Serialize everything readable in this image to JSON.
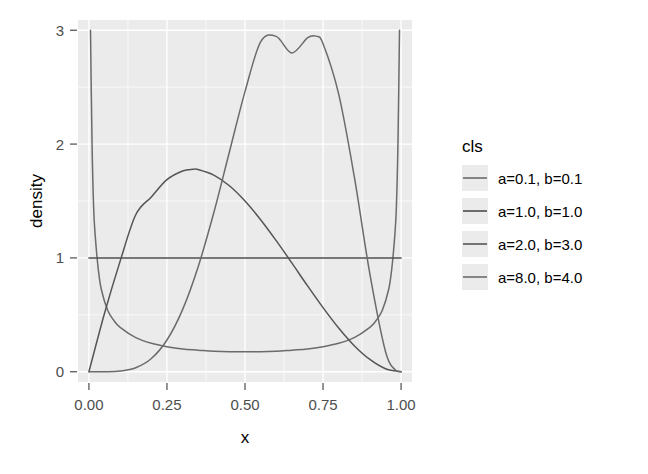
{
  "chart_data": {
    "type": "line",
    "title": "",
    "subtitle": "",
    "xlabel": "x",
    "ylabel": "density",
    "xlim": [
      -0.035,
      1.035
    ],
    "ylim": [
      -0.09,
      3.09
    ],
    "xticks": [
      "0.00",
      "0.25",
      "0.50",
      "0.75",
      "1.00"
    ],
    "xtick_values": [
      0.0,
      0.25,
      0.5,
      0.75,
      1.0
    ],
    "yticks": [
      "0",
      "1",
      "2",
      "3"
    ],
    "ytick_values": [
      0,
      1,
      2,
      3
    ],
    "grid": "major and minor white gridlines on grey panel",
    "legend_position": "right",
    "legend_title": "cls",
    "panel_background": "#ebebeb",
    "gridline_color": "#ffffff",
    "series": [
      {
        "name": "a=0.1, b=0.1",
        "color": "#6b6b6b",
        "distribution": "Beta(0.1, 0.1)",
        "x": [
          0.005,
          0.01,
          0.015,
          0.02,
          0.03,
          0.04,
          0.06,
          0.08,
          0.1,
          0.15,
          0.2,
          0.25,
          0.3,
          0.35,
          0.4,
          0.45,
          0.5,
          0.55,
          0.6,
          0.65,
          0.7,
          0.75,
          0.8,
          0.85,
          0.9,
          0.92,
          0.94,
          0.96,
          0.97,
          0.98,
          0.985,
          0.99,
          0.995
        ],
        "values": [
          3.0,
          2.0,
          1.45,
          1.2,
          0.9,
          0.72,
          0.54,
          0.45,
          0.39,
          0.3,
          0.25,
          0.22,
          0.2,
          0.19,
          0.18,
          0.175,
          0.175,
          0.175,
          0.18,
          0.19,
          0.2,
          0.22,
          0.25,
          0.3,
          0.39,
          0.45,
          0.54,
          0.72,
          0.9,
          1.2,
          1.45,
          2.0,
          3.0
        ]
      },
      {
        "name": "a=1.0, b=1.0",
        "color": "#4d4d4d",
        "distribution": "Beta(1, 1) - uniform",
        "x": [
          0.0,
          0.25,
          0.5,
          0.75,
          1.0
        ],
        "values": [
          1.0,
          1.0,
          1.0,
          1.0,
          1.0
        ]
      },
      {
        "name": "a=2.0, b=3.0",
        "color": "#555555",
        "distribution": "Beta(2, 3)",
        "x": [
          0.0,
          0.05,
          0.1,
          0.15,
          0.2,
          0.25,
          0.3,
          0.3333,
          0.35,
          0.4,
          0.45,
          0.5,
          0.55,
          0.6,
          0.65,
          0.7,
          0.75,
          0.8,
          0.85,
          0.9,
          0.95,
          1.0
        ],
        "values": [
          0.0,
          0.514,
          0.972,
          1.379,
          1.536,
          1.688,
          1.764,
          1.778,
          1.776,
          1.728,
          1.634,
          1.5,
          1.336,
          1.152,
          0.956,
          0.756,
          0.563,
          0.384,
          0.229,
          0.108,
          0.027,
          0.0
        ]
      },
      {
        "name": "a=8.0, b=4.0",
        "color": "#6b6b6b",
        "distribution": "Beta(8, 4)",
        "x": [
          0.0,
          0.05,
          0.1,
          0.15,
          0.2,
          0.25,
          0.3,
          0.35,
          0.4,
          0.45,
          0.5,
          0.55,
          0.6,
          0.65,
          0.7,
          0.7273,
          0.75,
          0.8,
          0.85,
          0.9,
          0.95,
          0.98,
          1.0
        ],
        "values": [
          0.0,
          0.0002,
          0.006,
          0.035,
          0.116,
          0.279,
          0.546,
          0.923,
          1.397,
          1.931,
          2.461,
          2.897,
          2.946,
          2.8,
          2.933,
          2.948,
          2.882,
          2.441,
          1.716,
          0.86,
          0.178,
          0.02,
          0.0
        ]
      }
    ]
  },
  "axes": {
    "x_label": "x",
    "y_label": "density",
    "x_tick_labels": [
      "0.00",
      "0.25",
      "0.50",
      "0.75",
      "1.00"
    ],
    "y_tick_labels": [
      "0",
      "1",
      "2",
      "3"
    ]
  },
  "legend": {
    "title": "cls",
    "items": [
      {
        "label": "a=0.1, b=0.1",
        "color": "#6b6b6b"
      },
      {
        "label": "a=1.0, b=1.0",
        "color": "#4d4d4d"
      },
      {
        "label": "a=2.0, b=3.0",
        "color": "#555555"
      },
      {
        "label": "a=8.0, b=4.0",
        "color": "#6b6b6b"
      }
    ]
  },
  "colors": {
    "panel": "#ebebeb",
    "grid": "#ffffff",
    "text": "#000000",
    "tick_text": "#4d4d4d",
    "curve": "#5a5a5a"
  }
}
